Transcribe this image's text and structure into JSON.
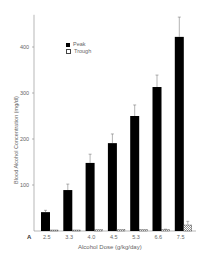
{
  "panel_label": "A",
  "chart_data": {
    "type": "bar",
    "title": "",
    "xlabel": "Alcohol Dose (g/kg/day)",
    "ylabel": "Blood Alcohol Concentration (mg/dl)",
    "categories": [
      "2.5",
      "3.3",
      "4.0",
      "4.5",
      "5.3",
      "6.6",
      "7.5"
    ],
    "ylim": [
      0,
      470
    ],
    "yticks": [
      100,
      200,
      300,
      400
    ],
    "grid": false,
    "legend_position": "upper-left",
    "series": [
      {
        "name": "Peak",
        "fill": "#000000",
        "values": [
          41,
          89,
          148,
          191,
          250,
          313,
          422
        ],
        "error": [
          4,
          13,
          19,
          20,
          24,
          26,
          43
        ]
      },
      {
        "name": "Trough",
        "fill": "hatched",
        "values": [
          2,
          2,
          3,
          3,
          3,
          3,
          13
        ],
        "error": [
          0,
          0,
          0,
          0,
          0,
          1,
          8
        ]
      }
    ]
  },
  "legend": {
    "items": [
      "Peak",
      "Trough"
    ]
  }
}
